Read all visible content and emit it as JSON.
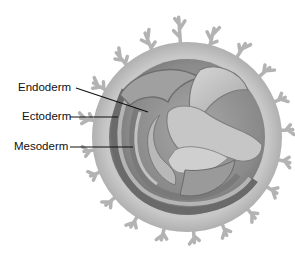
{
  "figure": {
    "labels": [
      {
        "id": "endoderm",
        "text": "Endoderm",
        "x": 18,
        "y": 82,
        "line": [
          76,
          88,
          148,
          112
        ]
      },
      {
        "id": "ectoderm",
        "text": "Ectoderm",
        "x": 22,
        "y": 111,
        "line": [
          70,
          117,
          118,
          117
        ]
      },
      {
        "id": "mesoderm",
        "text": "Mesoderm",
        "x": 14,
        "y": 140,
        "line": [
          70,
          147,
          133,
          147
        ]
      }
    ],
    "colors": {
      "villi": "#b4b4b4",
      "outer_ring": "#c3c3c3",
      "inner_disc": "#8e8e8e",
      "layer_light": "#bdbdbd",
      "layer_dark": "#6f6f6f",
      "label_line": "#111111"
    }
  }
}
